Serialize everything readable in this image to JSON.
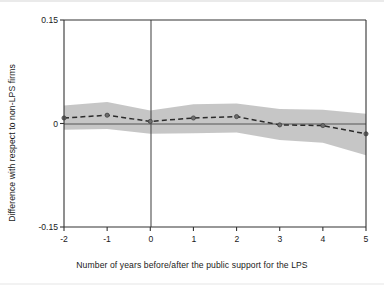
{
  "figure": {
    "kind": "event-study-plot",
    "background_color": "#ffffff"
  },
  "axes": {
    "ylabel": "Difference with respect to non-LPS firms",
    "xlabel": "Number of years before/after the public support for the LPS",
    "ytick_labels": [
      "0.15",
      "0",
      "-0.15"
    ],
    "xtick_labels": [
      "-2",
      "-1",
      "0",
      "1",
      "2",
      "3",
      "4",
      "5"
    ]
  },
  "colors": {
    "line": "#2b2b2b",
    "band": "#b9b9b9",
    "zero_line": "#555555",
    "event_line": "#4d4d4d",
    "frame": "#333333",
    "text": "#1a1a1a"
  },
  "chart_data": {
    "type": "line",
    "title": "",
    "subtitle": "",
    "xlabel": "Number of years before/after the public support for the LPS",
    "ylabel": "Difference with respect to non-LPS firms",
    "x": [
      -2,
      -1,
      0,
      1,
      2,
      3,
      4,
      5
    ],
    "xlim": [
      -2,
      5
    ],
    "ylim": [
      -0.15,
      0.15
    ],
    "yticks": [
      0.15,
      0,
      -0.15
    ],
    "xticks": [
      -2,
      -1,
      0,
      1,
      2,
      3,
      4,
      5
    ],
    "grid": false,
    "legend": null,
    "series": [
      {
        "name": "Point estimate",
        "style": "dashed-with-markers",
        "values": [
          0.008,
          0.012,
          0.003,
          0.008,
          0.01,
          -0.002,
          -0.003,
          -0.015
        ]
      },
      {
        "name": "Confidence interval upper bound",
        "style": "shaded-band",
        "values": [
          0.026,
          0.031,
          0.019,
          0.028,
          0.029,
          0.021,
          0.02,
          0.014
        ]
      },
      {
        "name": "Confidence interval lower bound",
        "style": "shaded-band",
        "values": [
          -0.009,
          -0.008,
          -0.015,
          -0.014,
          -0.013,
          -0.024,
          -0.028,
          -0.046
        ]
      }
    ],
    "annotations": [
      {
        "type": "vline",
        "x": 0,
        "label": "event time (public support year)"
      },
      {
        "type": "hline",
        "y": 0,
        "label": "zero reference"
      }
    ]
  }
}
